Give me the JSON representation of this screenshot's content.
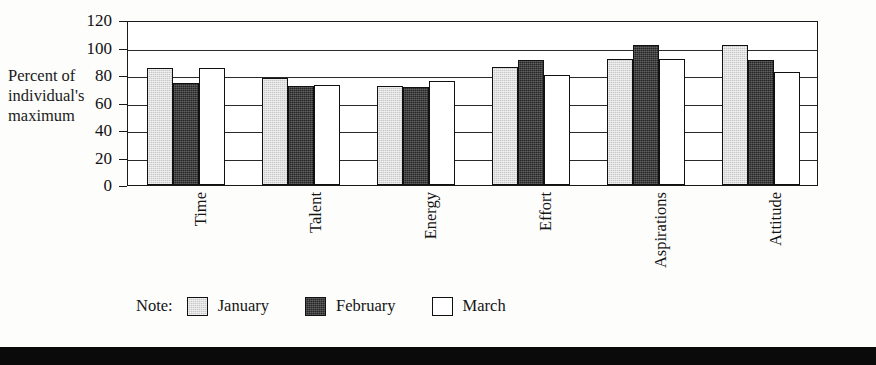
{
  "chart_data": {
    "type": "bar",
    "title": "",
    "subtitle": "",
    "xlabel": "",
    "ylabel": "Percent of individual's maximum",
    "ylabel_lines": [
      "Percent of",
      "individual's",
      "maximum"
    ],
    "categories": [
      "Time",
      "Talent",
      "Energy",
      "Effort",
      "Aspirations",
      "Attitude"
    ],
    "series": [
      {
        "name": "January",
        "color": "#c9c9c9",
        "values": [
          85,
          78,
          72,
          86,
          92,
          102
        ]
      },
      {
        "name": "February",
        "color": "#262626",
        "values": [
          74,
          72,
          71,
          91,
          102,
          91
        ]
      },
      {
        "name": "March",
        "color": "#ffffff",
        "values": [
          85,
          73,
          76,
          80,
          92,
          82
        ]
      }
    ],
    "ylim": [
      0,
      120
    ],
    "ytick_step": 20,
    "yticks": [
      0,
      20,
      40,
      60,
      80,
      100,
      120
    ],
    "ytick_labels": [
      "0",
      "20",
      "40",
      "60",
      "80",
      "100",
      "120"
    ],
    "grid": true,
    "grid_axis": "y",
    "legend_position": "bottom-left",
    "legend_prefix": "Note:",
    "category_label_rotation": -90,
    "annotations": []
  },
  "legend": {
    "note_label": "Note:",
    "entries": [
      {
        "label": "January"
      },
      {
        "label": "February"
      },
      {
        "label": "March"
      }
    ]
  },
  "footer": {
    "band_text": ""
  }
}
